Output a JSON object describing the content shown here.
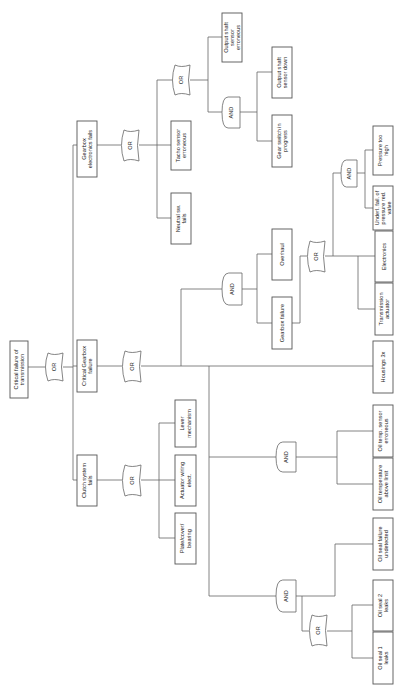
{
  "diagram": {
    "type": "fault-tree",
    "orientation": "rotated-90-ccw",
    "line_color": "#666666",
    "box_border_color": "#555555",
    "background": "#ffffff",
    "nodes": [
      {
        "id": "root",
        "label": [
          "Critical failure of",
          "transmission"
        ],
        "x": 10,
        "y": 341,
        "w": 18,
        "h": 57
      },
      {
        "id": "g_root",
        "gate": "OR",
        "x": 45,
        "y": 353,
        "w": 18,
        "h": 28
      },
      {
        "id": "gef",
        "label": [
          "Gearbox",
          "electronics fails"
        ],
        "x": 77,
        "y": 121,
        "w": 20,
        "h": 56
      },
      {
        "id": "cgf",
        "label": [
          "Critical Gearbox",
          "failure"
        ],
        "x": 77,
        "y": 340,
        "w": 20,
        "h": 52
      },
      {
        "id": "csf",
        "label": [
          "Clutch system",
          "fails"
        ],
        "x": 77,
        "y": 455,
        "w": 20,
        "h": 51
      },
      {
        "id": "g_gef",
        "gate": "OR",
        "x": 121,
        "y": 130,
        "w": 18,
        "h": 31
      },
      {
        "id": "g_cgf",
        "gate": "OR",
        "x": 122,
        "y": 351,
        "w": 19,
        "h": 31
      },
      {
        "id": "g_csf",
        "gate": "OR",
        "x": 122,
        "y": 465,
        "w": 19,
        "h": 31
      },
      {
        "id": "tacho",
        "label": [
          "Tacho sensor",
          "erroneous"
        ],
        "x": 171,
        "y": 121,
        "w": 20,
        "h": 49
      },
      {
        "id": "neutral",
        "label": [
          "Neutral sw.",
          "fails"
        ],
        "x": 171,
        "y": 193,
        "w": 20,
        "h": 51
      },
      {
        "id": "g_tacho",
        "gate": "OR",
        "x": 172,
        "y": 65,
        "w": 18,
        "h": 30
      },
      {
        "id": "lever",
        "label": [
          "Lever",
          "mechanism"
        ],
        "x": 175,
        "y": 400,
        "w": 21,
        "h": 47
      },
      {
        "id": "actuator_wiring",
        "label": [
          "Actuator wiring",
          "elect."
        ],
        "x": 175,
        "y": 455,
        "w": 21,
        "h": 51
      },
      {
        "id": "plate",
        "label": [
          "Plate/cover/",
          "bearing"
        ],
        "x": 175,
        "y": 513,
        "w": 21,
        "h": 51
      },
      {
        "id": "ossens_err",
        "label": [
          "Output shaft",
          "sensor",
          "erroneous"
        ],
        "x": 222,
        "y": 13,
        "w": 20,
        "h": 49
      },
      {
        "id": "g_and_os",
        "gate": "AND",
        "x": 222,
        "y": 97,
        "w": 18,
        "h": 31
      },
      {
        "id": "g_and_gb",
        "gate": "AND",
        "x": 222,
        "y": 273,
        "w": 20,
        "h": 32
      },
      {
        "id": "ossens_down",
        "label": [
          "Output shaft",
          "sensor down"
        ],
        "x": 272,
        "y": 47,
        "w": 20,
        "h": 51
      },
      {
        "id": "gear_switch",
        "label": [
          "Gear switch in",
          "progress"
        ],
        "x": 272,
        "y": 115,
        "w": 20,
        "h": 52
      },
      {
        "id": "overhaul",
        "label": [
          "Overhaul"
        ],
        "x": 272,
        "y": 229,
        "w": 20,
        "h": 51
      },
      {
        "id": "gearbox_failure",
        "label": [
          "Gearbox failure"
        ],
        "x": 272,
        "y": 297,
        "w": 20,
        "h": 52
      },
      {
        "id": "g_and_oiltemp",
        "gate": "AND",
        "x": 276,
        "y": 442,
        "w": 20,
        "h": 30
      },
      {
        "id": "g_and_oilseal",
        "gate": "AND",
        "x": 276,
        "y": 580,
        "w": 20,
        "h": 32
      },
      {
        "id": "g_or_gbf",
        "gate": "OR",
        "x": 307,
        "y": 241,
        "w": 18,
        "h": 31
      },
      {
        "id": "g_or_seal",
        "gate": "OR",
        "x": 309,
        "y": 615,
        "w": 18,
        "h": 31
      },
      {
        "id": "g_and_press",
        "gate": "AND",
        "x": 341,
        "y": 160,
        "w": 16,
        "h": 27
      },
      {
        "id": "pressure_high",
        "label": [
          "Pressure too",
          "high"
        ],
        "x": 373,
        "y": 126,
        "w": 20,
        "h": 49
      },
      {
        "id": "underl",
        "label": [
          "Underl. fail. of",
          "pressure red.",
          "valve"
        ],
        "x": 373,
        "y": 186,
        "w": 20,
        "h": 44
      },
      {
        "id": "electronics",
        "label": [
          "Electronics"
        ],
        "x": 375,
        "y": 231,
        "w": 18,
        "h": 51
      },
      {
        "id": "trans_act",
        "label": [
          "Transmission",
          "actuator"
        ],
        "x": 375,
        "y": 283,
        "w": 18,
        "h": 52
      },
      {
        "id": "housings",
        "label": [
          "Housings 3x"
        ],
        "x": 373,
        "y": 341,
        "w": 20,
        "h": 52
      },
      {
        "id": "oil_temp_sensor",
        "label": [
          "Oil temp. sensor",
          "erroneous"
        ],
        "x": 373,
        "y": 405,
        "w": 20,
        "h": 52
      },
      {
        "id": "oil_temp_limit",
        "label": [
          "Oil temperature",
          "above limit"
        ],
        "x": 373,
        "y": 458,
        "w": 20,
        "h": 52
      },
      {
        "id": "oil_seal_undet",
        "label": [
          "Oil seal failure",
          "undetected"
        ],
        "x": 373,
        "y": 518,
        "w": 20,
        "h": 52
      },
      {
        "id": "oil_seal_2",
        "label": [
          "Oil seal 2",
          "leaks"
        ],
        "x": 373,
        "y": 580,
        "w": 20,
        "h": 51
      },
      {
        "id": "oil_seal_1",
        "label": [
          "Oil seal 1",
          "leaks"
        ],
        "x": 373,
        "y": 632,
        "w": 20,
        "h": 52
      }
    ],
    "lines": [
      "M28,367 L45,367",
      "M63,367 L73,367",
      "M73,145 L73,480",
      "M73,145 L77,145",
      "M73,366 L77,366",
      "M73,480 L77,480",
      "M97,145 L121,145",
      "M139,145 L157,145",
      "M157,80 L157,218",
      "M157,80 L172,80",
      "M157,145 L171,145",
      "M157,218 L171,218",
      "M190,80 L208,80",
      "M208,37 L208,112",
      "M208,37 L222,37",
      "M208,112 L222,112",
      "M240,112 L257,112",
      "M257,72 L257,141",
      "M257,72 L272,72",
      "M257,141 L272,141",
      "M97,366 L122,366",
      "M141,366 L393,366",
      "M181,289 L181,366",
      "M181,289 L222,289",
      "M242,289 L257,289",
      "M257,254 L257,323",
      "M257,254 L272,254",
      "M257,323 L272,323",
      "M292,323 L300,323",
      "M300,256 L300,323",
      "M300,256 L307,256",
      "M325,256 L358,256",
      "M341,173 L333,173",
      "M333,173 L333,256",
      "M358,256 L358,309",
      "M358,256 L375,256",
      "M358,309 L375,309",
      "M357,173 L365,173",
      "M365,150 L365,208",
      "M365,150 L373,150",
      "M365,208 L373,208",
      "M209,366 L209,596",
      "M209,457 L276,457",
      "M296,457 L337,457",
      "M337,431 L337,484",
      "M337,431 L373,431",
      "M337,484 L373,484",
      "M209,596 L276,596",
      "M296,596 L335,596",
      "M335,544 L335,596",
      "M335,544 L373,544",
      "M302,596 L302,631",
      "M302,631 L309,631",
      "M327,631 L352,631",
      "M352,605 L352,658",
      "M352,605 L373,605",
      "M352,658 L373,658",
      "M97,480 L122,480",
      "M141,480 L159,480",
      "M159,423 L159,538",
      "M159,423 L175,423",
      "M159,480 L175,480",
      "M159,538 L175,538"
    ]
  }
}
